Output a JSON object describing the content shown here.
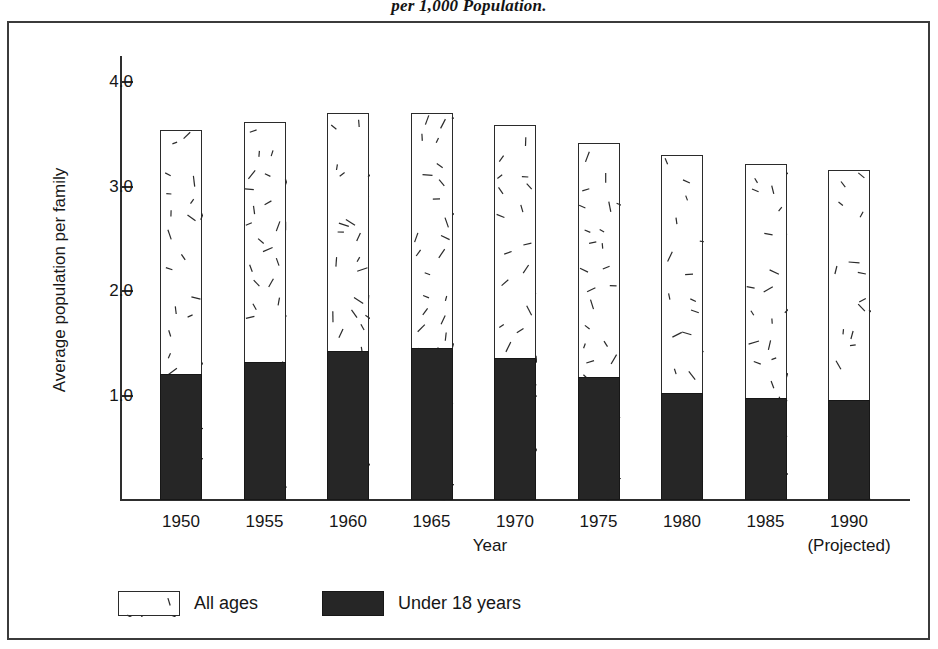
{
  "title": {
    "supertitle": "per 1,000 Population."
  },
  "chart_data": {
    "type": "bar",
    "title": "per 1,000 Population.",
    "xlabel": "Year",
    "ylabel": "Average population per family",
    "ylim": [
      0,
      4.3
    ],
    "yticks": [
      "1.0",
      "2.0",
      "3.0",
      "4.0"
    ],
    "ytick_values": [
      1.0,
      2.0,
      3.0,
      4.0
    ],
    "grid": false,
    "legend_position": "bottom-left",
    "categories": [
      "1950",
      "1955",
      "1960",
      "1965",
      "1970",
      "1975",
      "1980",
      "1985",
      "1990"
    ],
    "category_sublabels": [
      "",
      "",
      "",
      "",
      "",
      "",
      "",
      "",
      "(Projected)"
    ],
    "series": [
      {
        "name": "All ages",
        "style": "hatched-dashes",
        "color": "#ffffff",
        "values": [
          3.54,
          3.62,
          3.7,
          3.7,
          3.59,
          3.42,
          3.3,
          3.22,
          3.16
        ]
      },
      {
        "name": "Under 18 years",
        "style": "solid-fill",
        "color": "#262626",
        "values": [
          1.21,
          1.32,
          1.43,
          1.45,
          1.36,
          1.18,
          1.02,
          0.98,
          0.96
        ]
      }
    ]
  },
  "legend": {
    "items": [
      {
        "label": "All ages",
        "style": "hatched"
      },
      {
        "label": "Under 18 years",
        "style": "solid"
      }
    ]
  },
  "colors": {
    "frame": "#3b3b3b",
    "axis": "#2e2e2e",
    "bar_fill_under18": "#262626",
    "bar_fill_allages": "#ffffff",
    "bar_outline": "#2b2b2b",
    "text": "#161616",
    "background": "#ffffff"
  }
}
